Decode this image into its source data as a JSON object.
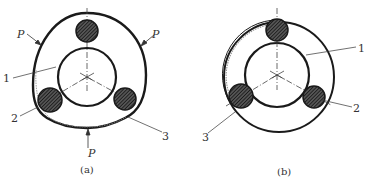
{
  "figure": {
    "panels": [
      {
        "id": "a",
        "caption": "(a)",
        "labels": {
          "force_top_left": "P",
          "force_top_right": "P",
          "force_bottom": "P",
          "part_1": "1",
          "part_2": "2",
          "part_3": "3"
        },
        "description": "Three rollers between inner ring and deformed (rounded-triangle) outer ring under three radial loads P"
      },
      {
        "id": "b",
        "caption": "(b)",
        "labels": {
          "part_1": "1",
          "part_2": "2",
          "part_3": "3"
        },
        "description": "Three rollers between inner ring and circular outer ring"
      }
    ],
    "colors": {
      "stroke": "#1a1a1a",
      "hatch": "#333333",
      "text": "#333333",
      "background": "#ffffff"
    }
  }
}
